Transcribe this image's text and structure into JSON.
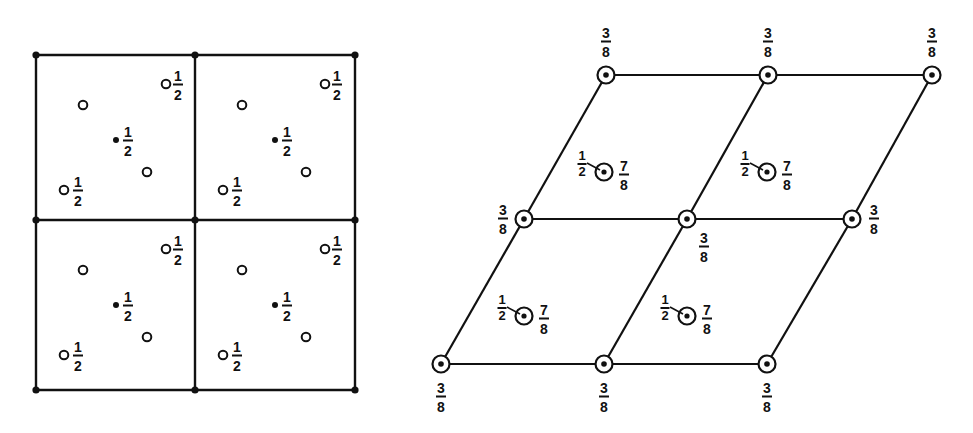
{
  "diagram": {
    "left_panel": {
      "name": "square-lattice-projection",
      "grid": {
        "x": [
          36,
          195,
          355
        ],
        "y": [
          55,
          220,
          390
        ]
      },
      "cell_offsets": [
        [
          0,
          0
        ],
        [
          159,
          0
        ],
        [
          0,
          165
        ],
        [
          159,
          165
        ]
      ],
      "points_in_cell": [
        {
          "type": "open",
          "dx": 130,
          "dy": 29,
          "label": {
            "num": "1",
            "den": "2"
          },
          "ldx": 12
        },
        {
          "type": "open",
          "dx": 47,
          "dy": 50,
          "label": null
        },
        {
          "type": "filled",
          "dx": 80,
          "dy": 85,
          "label": {
            "num": "1",
            "den": "2"
          },
          "ldx": 12
        },
        {
          "type": "open",
          "dx": 111,
          "dy": 117,
          "label": null
        },
        {
          "type": "open",
          "dx": 28,
          "dy": 135,
          "label": {
            "num": "1",
            "den": "2"
          },
          "ldx": 14
        }
      ],
      "corner_label": null
    },
    "right_panel": {
      "name": "rhombic-lattice-projection",
      "nodes": [
        {
          "x": 441,
          "y": 364,
          "label": {
            "num": "3",
            "den": "8"
          },
          "lx": 441,
          "ly": 397
        },
        {
          "x": 604,
          "y": 364,
          "label": {
            "num": "3",
            "den": "8"
          },
          "lx": 604,
          "ly": 397
        },
        {
          "x": 767,
          "y": 364,
          "label": {
            "num": "3",
            "den": "8"
          },
          "lx": 767,
          "ly": 397
        },
        {
          "x": 524,
          "y": 219,
          "label": {
            "num": "3",
            "den": "8"
          },
          "lx": 503,
          "ly": 219
        },
        {
          "x": 687,
          "y": 219,
          "label": {
            "num": "3",
            "den": "8"
          },
          "lx": 704,
          "ly": 247
        },
        {
          "x": 852,
          "y": 219,
          "label": {
            "num": "3",
            "den": "8"
          },
          "lx": 874,
          "ly": 219
        },
        {
          "x": 606,
          "y": 75,
          "label": {
            "num": "3",
            "den": "8"
          },
          "lx": 606,
          "ly": 42
        },
        {
          "x": 768,
          "y": 75,
          "label": {
            "num": "3",
            "den": "8"
          },
          "lx": 768,
          "ly": 42
        },
        {
          "x": 932,
          "y": 75,
          "label": {
            "num": "3",
            "den": "8"
          },
          "lx": 932,
          "ly": 42
        }
      ],
      "edges": [
        [
          0,
          1
        ],
        [
          1,
          2
        ],
        [
          3,
          4
        ],
        [
          4,
          5
        ],
        [
          6,
          7
        ],
        [
          7,
          8
        ],
        [
          0,
          3
        ],
        [
          3,
          6
        ],
        [
          1,
          4
        ],
        [
          4,
          7
        ],
        [
          2,
          5
        ],
        [
          5,
          8
        ]
      ],
      "centers": [
        {
          "x": 604,
          "y": 172,
          "left": {
            "num": "1",
            "den": "2"
          },
          "right": {
            "num": "7",
            "den": "8"
          }
        },
        {
          "x": 767,
          "y": 172,
          "left": {
            "num": "1",
            "den": "2"
          },
          "right": {
            "num": "7",
            "den": "8"
          }
        },
        {
          "x": 524,
          "y": 316,
          "left": {
            "num": "1",
            "den": "2"
          },
          "right": {
            "num": "7",
            "den": "8"
          }
        },
        {
          "x": 687,
          "y": 316,
          "left": {
            "num": "1",
            "den": "2"
          },
          "right": {
            "num": "7",
            "den": "8"
          }
        }
      ]
    },
    "colors": {
      "ink": "#111111",
      "background": "#ffffff"
    }
  }
}
